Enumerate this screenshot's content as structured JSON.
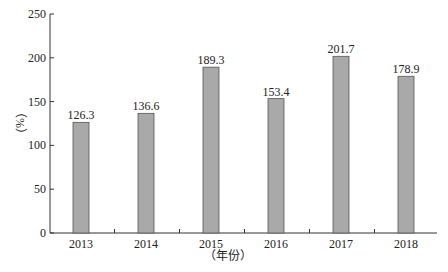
{
  "chart_data": {
    "type": "bar",
    "title": "",
    "xlabel": "（年份）",
    "ylabel": "（%）",
    "categories": [
      "2013",
      "2014",
      "2015",
      "2016",
      "2017",
      "2018"
    ],
    "values": [
      126.3,
      136.6,
      189.3,
      153.4,
      201.7,
      178.9
    ],
    "value_labels": [
      "126.3",
      "136.6",
      "189.3",
      "153.4",
      "201.7",
      "178.9"
    ],
    "ylim": [
      0,
      250
    ],
    "yticks": [
      0,
      50,
      100,
      150,
      200,
      250
    ],
    "ytick_labels": [
      "0",
      "50",
      "100",
      "150",
      "200",
      "250"
    ],
    "grid": false,
    "legend": null,
    "bar_color": "#a9a9a9",
    "bar_edge_color": "#555555"
  }
}
